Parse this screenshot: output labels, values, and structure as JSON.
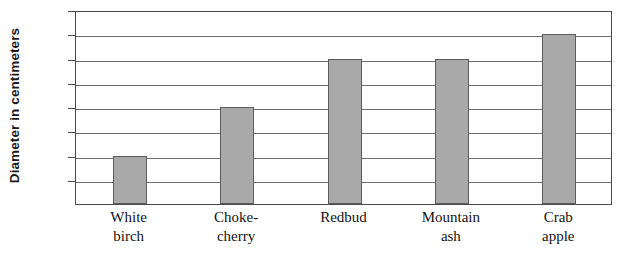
{
  "chart_data": {
    "type": "bar",
    "title": "",
    "xlabel": "",
    "ylabel": "Diameter in centimeters",
    "categories": [
      "White birch",
      "Choke-cherry",
      "Redbud",
      "Mountain ash",
      "Crab apple"
    ],
    "category_lines": [
      [
        "White",
        "birch"
      ],
      [
        "Choke-",
        "cherry"
      ],
      [
        "Redbud",
        ""
      ],
      [
        "Mountain",
        "ash"
      ],
      [
        "Crab",
        "apple"
      ]
    ],
    "values": [
      10,
      20,
      30,
      30,
      35
    ],
    "ylim": [
      0,
      40
    ],
    "ytick_values": [
      40,
      35,
      30,
      25,
      20,
      15,
      10,
      5
    ],
    "ytick_labels": [
      "40",
      "35",
      "30",
      "25",
      "20",
      "15",
      "10",
      "5"
    ],
    "grid": true,
    "legend": false,
    "bar_color": "#a9a9a9",
    "bar_border_color": "#5c5c5c",
    "axis_color": "#4a4a4a",
    "grid_color": "#6e6e6e"
  }
}
